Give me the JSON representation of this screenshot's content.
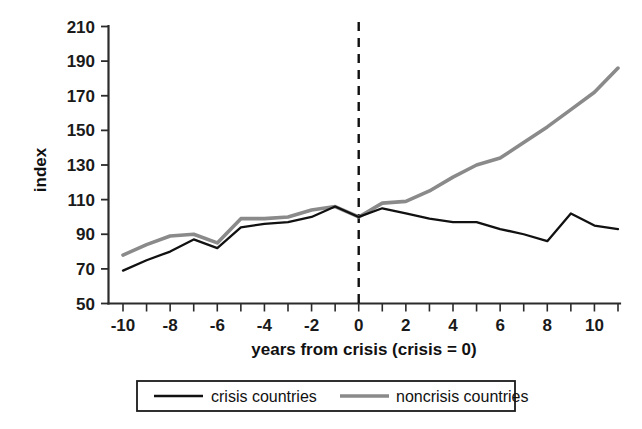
{
  "chart_data": {
    "type": "line",
    "title": "",
    "xlabel": "years from crisis (crisis = 0)",
    "ylabel": "index",
    "xlim": [
      -10.5,
      11.5
    ],
    "ylim": [
      50,
      210
    ],
    "ytick_values": [
      50,
      70,
      90,
      110,
      130,
      150,
      170,
      190,
      210
    ],
    "ytick_labels": [
      "50",
      "70",
      "90",
      "110",
      "130",
      "150",
      "170",
      "190",
      "210"
    ],
    "xtick_values": [
      -10,
      -9,
      -8,
      -7,
      -6,
      -5,
      -4,
      -3,
      -2,
      -1,
      0,
      1,
      2,
      3,
      4,
      5,
      6,
      7,
      8,
      9,
      10,
      11
    ],
    "xtick_labels_shown": [
      "-10",
      "-8",
      "-6",
      "-4",
      "-2",
      "0",
      "2",
      "4",
      "6",
      "8",
      "10"
    ],
    "xtick_labels_values": [
      -10,
      -8,
      -6,
      -4,
      -2,
      0,
      2,
      4,
      6,
      8,
      10
    ],
    "grid": false,
    "legend_position": "bottom-center",
    "x": [
      -10,
      -9,
      -8,
      -7,
      -6,
      -5,
      -4,
      -3,
      -2,
      -1,
      0,
      1,
      2,
      3,
      4,
      5,
      6,
      7,
      8,
      9,
      10,
      11
    ],
    "series": [
      {
        "name": "crisis countries",
        "color": "#111111",
        "values": [
          69,
          75,
          80,
          87,
          82,
          94,
          96,
          97,
          100,
          106,
          100,
          105,
          102,
          99,
          97,
          97,
          93,
          90,
          86,
          102,
          95,
          93
        ]
      },
      {
        "name": "noncrisis countries",
        "color": "#8a8a8a",
        "values": [
          78,
          84,
          89,
          90,
          85,
          99,
          99,
          100,
          104,
          106,
          100,
          108,
          109,
          115,
          123,
          130,
          134,
          143,
          152,
          162,
          172,
          186
        ]
      }
    ],
    "annotations": [
      {
        "name": "crisis-year-marker",
        "type": "vline",
        "x": 0,
        "style": "dashed",
        "color": "#111111"
      }
    ]
  },
  "legend": {
    "items": [
      {
        "label": "crisis countries",
        "color": "#111111",
        "width": 2.3
      },
      {
        "label": "noncrisis countries",
        "color": "#8a8a8a",
        "width": 3.6
      }
    ]
  }
}
